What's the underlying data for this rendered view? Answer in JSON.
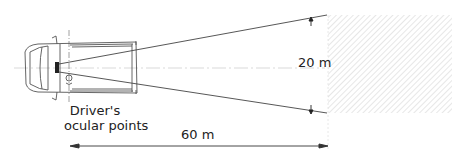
{
  "diagram": {
    "labels": {
      "lateral_distance": "20 m",
      "forward_distance": "60 m",
      "ocular_line1": "Driver's",
      "ocular_line2": "ocular points"
    },
    "elements": {
      "vehicle": "van-top-view",
      "field_of_view": "sight-lines-wedge",
      "target_zone": "hatched-area"
    },
    "colors": {
      "line": "#444444",
      "hatch": "#dddddd",
      "text": "#222222"
    }
  }
}
